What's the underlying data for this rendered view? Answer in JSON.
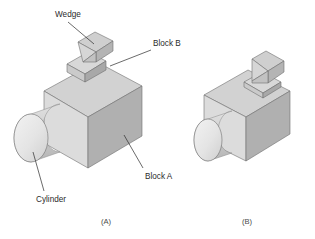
{
  "figure": {
    "background_color": "#ffffff",
    "line_color": "#2b2b2b",
    "type": "isometric-assembly-illustration"
  },
  "labels": {
    "wedge": "Wedge",
    "block_b": "Block B",
    "block_a": "Block A",
    "cylinder": "Cylinder"
  },
  "captions": {
    "left": "(A)",
    "right": "(B)"
  },
  "views": {
    "exploded": {
      "caption": "(A)",
      "description": "Exploded isometric view with labelled parts"
    },
    "assembled": {
      "caption": "(B)",
      "description": "Assembled isometric view, unlabelled"
    }
  },
  "parts": [
    {
      "name": "Block A",
      "shape": "rectangular-prism",
      "role": "base body"
    },
    {
      "name": "Block B",
      "shape": "thin-rectangular-plate",
      "role": "spacer on top of Block A"
    },
    {
      "name": "Wedge",
      "shape": "triangular-prism",
      "role": "top part"
    },
    {
      "name": "Cylinder",
      "shape": "cylinder",
      "role": "horizontal boss on left face of Block A"
    }
  ],
  "shading": {
    "top_face": "#d0d0d0",
    "left_face": "#dcdcdc",
    "right_face": "#b2b2b2",
    "cylinder_end": "#e6e6e6",
    "cylinder_body": "#c4c4c4",
    "wedge_slope": "#cfcfcf",
    "wedge_side": "#bdbdbd"
  }
}
